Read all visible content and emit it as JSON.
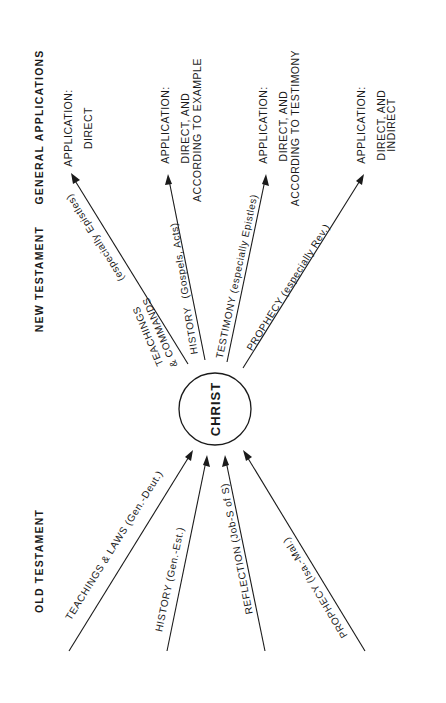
{
  "headers": {
    "general_applications": "GENERAL APPLICATIONS",
    "new_testament": "NEW TESTAMENT",
    "old_testament": "OLD TESTAMENT"
  },
  "center": {
    "label": "CHRIST"
  },
  "new_testament": [
    {
      "label_main_1": "TEACHINGS",
      "label_main_2": "& COMMANDS",
      "label_sub": "(especially Epistles)"
    },
    {
      "label_main": "HISTORY",
      "label_sub": "(Gospels, Acts)"
    },
    {
      "label": "TESTIMONY  (especially Epistles)"
    },
    {
      "label": "PROPHECY  (especially Rev.)"
    }
  ],
  "applications": [
    {
      "title": "APPLICATION:",
      "line1": "DIRECT",
      "line2": ""
    },
    {
      "title": "APPLICATION:",
      "line1": "DIRECT, AND",
      "line2": "ACCORDING TO EXAMPLE"
    },
    {
      "title": "APPLICATION:",
      "line1": "DIRECT, AND",
      "line2": "ACCORDING TO TESTIMONY"
    },
    {
      "title": "APPLICATION:",
      "line1": "DIRECT, AND",
      "line2": "INDIRECT"
    }
  ],
  "old_testament": [
    {
      "label": "TEACHINGS  &  LAWS  (Gen.-Deut.)"
    },
    {
      "label": "HISTORY  (Gen.-Est.)"
    },
    {
      "label": "REFLECTION  (Job-S of S)"
    },
    {
      "label": "PROPHECY  (Isa.-Mal.)"
    }
  ],
  "colors": {
    "ink": "#1a1a1a",
    "background": "#ffffff"
  }
}
